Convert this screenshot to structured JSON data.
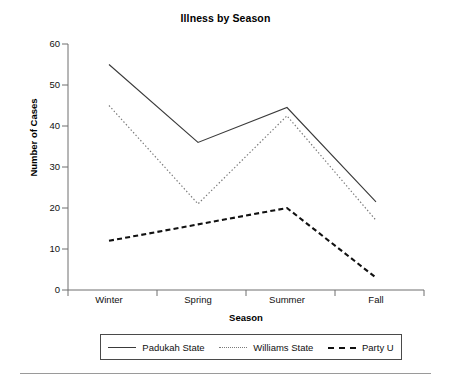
{
  "chart_data": {
    "type": "line",
    "title": "Illness by Season",
    "xlabel": "Season",
    "ylabel": "Number of Cases",
    "categories": [
      "Winter",
      "Spring",
      "Summer",
      "Fall"
    ],
    "ylim": [
      0,
      60
    ],
    "yticks": [
      0,
      10,
      20,
      30,
      40,
      50,
      60
    ],
    "grid": false,
    "legend_position": "bottom",
    "series": [
      {
        "name": "Padukah State",
        "style": "solid",
        "color": "#3a3a3a",
        "values": [
          55,
          36,
          44.5,
          21.5
        ]
      },
      {
        "name": "Williams State",
        "style": "dotted",
        "color": "#7a7a7a",
        "values": [
          45,
          21,
          42.5,
          17
        ]
      },
      {
        "name": "Party U",
        "style": "dashed",
        "color": "#111111",
        "values": [
          12,
          16,
          20,
          3
        ]
      }
    ]
  },
  "axis": {
    "y_tick_labels": [
      "60",
      "50",
      "40",
      "30",
      "20",
      "10",
      "0"
    ],
    "x_tick_labels": [
      "Winter",
      "Spring",
      "Summer",
      "Fall"
    ]
  },
  "legend": {
    "items": [
      {
        "label": "Padukah State"
      },
      {
        "label": "Williams State"
      },
      {
        "label": "Party U"
      }
    ]
  },
  "colors": {
    "axis": "#6f6f6f",
    "series_solid": "#3a3a3a",
    "series_dotted": "#7a7a7a",
    "series_dashed": "#111111",
    "rule": "#9a9a9a"
  }
}
